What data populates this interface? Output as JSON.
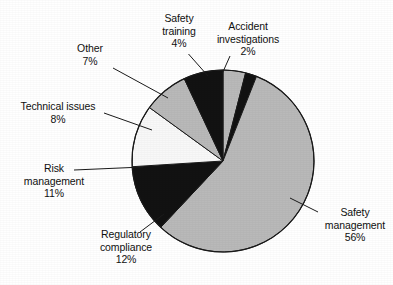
{
  "chart_data": {
    "type": "pie",
    "title": "",
    "subtitle": "",
    "xlabel": "",
    "ylabel": "",
    "legend_position": "none",
    "grid": false,
    "units": "percent",
    "total": 100,
    "start_angle_deg": 0,
    "direction": "clockwise",
    "categories": [
      "Safety training",
      "Accident investigations",
      "Safety management",
      "Regulatory compliance",
      "Risk management",
      "Technical issues",
      "Other"
    ],
    "values": [
      4,
      2,
      56,
      12,
      11,
      8,
      7
    ],
    "slices": [
      {
        "id": "safety-training",
        "label": "Safety training",
        "label_line1": "Safety",
        "label_line2": "training",
        "value": 4,
        "value_text": "4%",
        "color": "#b9b9b9",
        "start_deg": 0,
        "end_deg": 14.4
      },
      {
        "id": "accident-investigations",
        "label": "Accident investigations",
        "label_line1": "Accident",
        "label_line2": "investigations",
        "value": 2,
        "value_text": "2%",
        "color": "#121212",
        "start_deg": 14.4,
        "end_deg": 21.6
      },
      {
        "id": "safety-management",
        "label": "Safety management",
        "label_line1": "Safety",
        "label_line2": "management",
        "value": 56,
        "value_text": "56%",
        "color": "#b9b9b9",
        "start_deg": 21.6,
        "end_deg": 223.2
      },
      {
        "id": "regulatory-compliance",
        "label": "Regulatory compliance",
        "label_line1": "Regulatory",
        "label_line2": "compliance",
        "value": 12,
        "value_text": "12%",
        "color": "#121212",
        "start_deg": 223.2,
        "end_deg": 266.4
      },
      {
        "id": "risk-management",
        "label": "Risk management",
        "label_line1": "Risk",
        "label_line2": "management",
        "value": 11,
        "value_text": "11%",
        "color": "#f8f8f8",
        "start_deg": 266.4,
        "end_deg": 306.0
      },
      {
        "id": "technical-issues",
        "label": "Technical issues",
        "label_line1": "Technical issues",
        "label_line2": "",
        "value": 8,
        "value_text": "8%",
        "color": "#b9b9b9",
        "start_deg": 306.0,
        "end_deg": 334.8
      },
      {
        "id": "other",
        "label": "Other",
        "label_line1": "Other",
        "label_line2": "",
        "value": 7,
        "value_text": "7%",
        "color": "#121212",
        "start_deg": 334.8,
        "end_deg": 360.0
      }
    ],
    "geometry": {
      "center_x": 223,
      "center_y": 161,
      "radius": 91,
      "outline_color": "#1a1a1a",
      "background": "#ffffff"
    }
  }
}
